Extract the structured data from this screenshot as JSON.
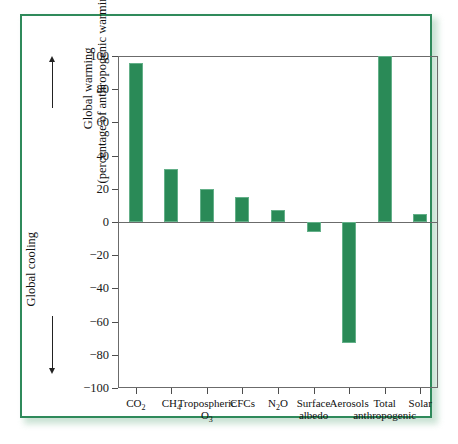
{
  "chart_data": {
    "type": "bar",
    "title": "",
    "subtitle": "",
    "xlabel": "",
    "ylabel": "Global warming (percentage of anthropogenic warming)",
    "ylabel_lower": "Global cooling",
    "ylim": [
      -100,
      100
    ],
    "yticks": [
      100,
      80,
      60,
      40,
      20,
      0,
      -20,
      -40,
      -60,
      -80,
      -100
    ],
    "ytick_labels": [
      "100",
      "80",
      "60",
      "40",
      "20",
      "0",
      "−20",
      "−40",
      "−60",
      "−80",
      "−100"
    ],
    "grid": false,
    "legend": "none",
    "bar_color": "#2a8a57",
    "categories": [
      "CO₂",
      "CH₄",
      "Tropospheric O₃",
      "CFCs",
      "N₂O",
      "Surface albedo",
      "Aerosols",
      "Total anthropogenic",
      "Solar"
    ],
    "category_labels": [
      {
        "line1": "CO",
        "sub1": "2",
        "line2": "",
        "sub2": ""
      },
      {
        "line1": "CH",
        "sub1": "4",
        "line2": "",
        "sub2": ""
      },
      {
        "line1": "Tropospheric",
        "sub1": "",
        "line2": "O",
        "sub2": "3"
      },
      {
        "line1": "CFCs",
        "sub1": "",
        "line2": "",
        "sub2": ""
      },
      {
        "line1": "N",
        "sub1": "2",
        "line1b": "O",
        "line2": "",
        "sub2": ""
      },
      {
        "line1": "Surface",
        "sub1": "",
        "line2": "albedo",
        "sub2": ""
      },
      {
        "line1": "Aerosols",
        "sub1": "",
        "line2": "",
        "sub2": ""
      },
      {
        "line1": "Total",
        "sub1": "",
        "line2": "anthropogenic",
        "sub2": ""
      },
      {
        "line1": "Solar",
        "sub1": "",
        "line2": "",
        "sub2": ""
      }
    ],
    "values": [
      96,
      32,
      20,
      15,
      7,
      -6,
      -73,
      100,
      5
    ]
  },
  "axis_titles": {
    "warming": "Global warming",
    "warming_detail": "(percentage of anthropogenic warming)",
    "cooling": "Global cooling"
  }
}
